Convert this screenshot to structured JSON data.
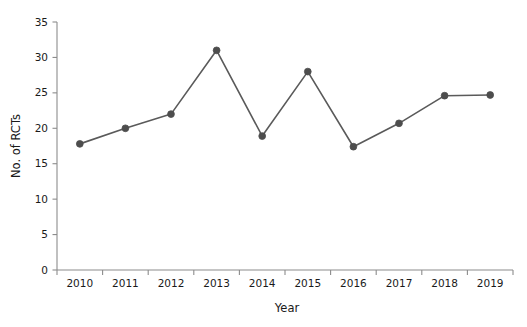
{
  "chart_data": {
    "type": "line",
    "title": "",
    "subtitle": "",
    "xlabel": "Year",
    "ylabel": "No. of RCTs",
    "categories": [
      "2010",
      "2011",
      "2012",
      "2013",
      "2014",
      "2015",
      "2016",
      "2017",
      "2018",
      "2019"
    ],
    "values": [
      17.8,
      20.0,
      22.0,
      31.0,
      18.9,
      28.0,
      17.4,
      20.7,
      24.6,
      24.7
    ],
    "series": [
      {
        "name": "No. of RCTs",
        "values": [
          17.8,
          20.0,
          22.0,
          31.0,
          18.9,
          28.0,
          17.4,
          20.7,
          24.6,
          24.7
        ]
      }
    ],
    "ylim": [
      0,
      35
    ],
    "ytick_labels": [
      "0",
      "5",
      "10",
      "15",
      "20",
      "25",
      "30",
      "35"
    ],
    "ytick_values": [
      0,
      5,
      10,
      15,
      20,
      25,
      30,
      35
    ],
    "xtick_labels": [
      "2010",
      "2011",
      "2012",
      "2013",
      "2014",
      "2015",
      "2016",
      "2017",
      "2018",
      "2019"
    ],
    "grid": false,
    "legend": false,
    "legend_position": "none",
    "line_color": "#5a5a5a",
    "marker_color": "#4d4d4d",
    "marker_shape": "circle",
    "axis_color": "#8c8c8c",
    "text_color": "#1a1a1a",
    "background_color": "#ffffff",
    "annotations": []
  }
}
